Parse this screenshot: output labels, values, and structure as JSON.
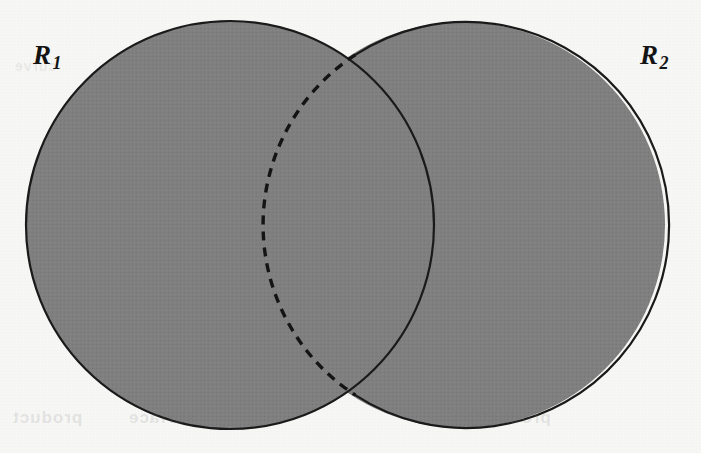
{
  "figure": {
    "type": "venn-diagram",
    "background_color": "#f7f7f5",
    "fill_color": "#808080",
    "stroke_color": "#1a1a1a",
    "stroke_width": 2,
    "dash_pattern": "9 7",
    "circles": [
      {
        "id": "R1",
        "label": "R",
        "subscript": "1",
        "cx": 230,
        "cy": 225,
        "r": 204,
        "boundary_style": "solid"
      },
      {
        "id": "R2",
        "label": "R",
        "subscript": "2",
        "cx": 462,
        "cy": 225,
        "r": 203,
        "boundary_style": "dashed-in-overlap"
      }
    ],
    "intersection_points": [
      {
        "x": 355,
        "y": 55
      },
      {
        "x": 355,
        "y": 396
      }
    ],
    "labels": [
      {
        "name": "label-r1",
        "text": "R",
        "subscript": "1",
        "x": 33,
        "y": 42
      },
      {
        "name": "label-r2",
        "text": "R",
        "subscript": "2",
        "x": 640,
        "y": 42
      }
    ]
  },
  "labels": {
    "r1": {
      "base": "R",
      "sub": "1"
    },
    "r2": {
      "base": "R",
      "sub": "2"
    }
  },
  "showthrough": {
    "left": "product",
    "mid": "surface",
    "right": "production",
    "top_left": "curve"
  }
}
